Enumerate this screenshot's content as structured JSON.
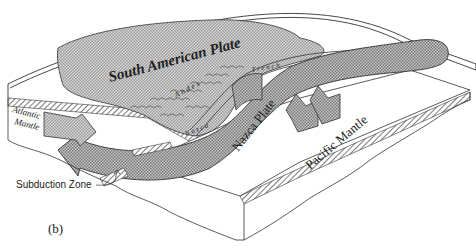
{
  "figure": {
    "panel_label": "(b)",
    "labels": {
      "south_american_plate": "South American Plate",
      "andes": "A n d e s",
      "trench": "T r e n c h",
      "nazca_small": "N a z c a",
      "nazca_plate": "Nazca Plate",
      "pacific_mantle": "Pacific Mantle",
      "atlantic_mantle_line1": "Atlantic",
      "atlantic_mantle_line2": "Mantle",
      "subduction_zone": "Subduction Zone"
    },
    "colors": {
      "line": "#333333",
      "continent_fill": "#c8c8c8",
      "arrow_fill": "#b4b4b4",
      "background": "#ffffff"
    }
  }
}
